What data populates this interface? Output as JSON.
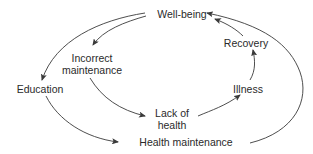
{
  "diagram": {
    "type": "cycle-flow",
    "colors": {
      "text": "#2a2a2a",
      "arrow": "#3a3a3a",
      "background": "#ffffff"
    },
    "nodes": {
      "wellbeing": {
        "label": "Well-being"
      },
      "incorrect": {
        "line1": "Incorrect",
        "line2": "maintenance"
      },
      "education": {
        "label": "Education"
      },
      "lack": {
        "line1": "Lack of",
        "line2": "health"
      },
      "illness": {
        "label": "Illness"
      },
      "recovery": {
        "label": "Recovery"
      },
      "healthmaint": {
        "label": "Health maintenance"
      }
    },
    "edges": [
      {
        "from": "Well-being",
        "to": "Incorrect maintenance"
      },
      {
        "from": "Well-being",
        "to": "Education"
      },
      {
        "from": "Incorrect maintenance",
        "to": "Lack of health"
      },
      {
        "from": "Lack of health",
        "to": "Illness"
      },
      {
        "from": "Illness",
        "to": "Recovery"
      },
      {
        "from": "Recovery",
        "to": "Well-being"
      },
      {
        "from": "Education",
        "to": "Health maintenance"
      },
      {
        "from": "Health maintenance",
        "to": "Well-being"
      }
    ]
  }
}
